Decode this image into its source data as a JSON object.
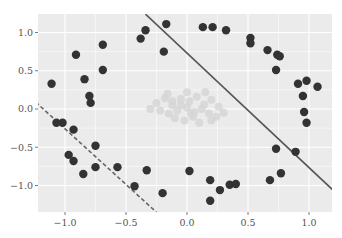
{
  "chart_data": {
    "type": "scatter",
    "title": "",
    "xlabel": "",
    "ylabel": "",
    "xlim": [
      -1.24,
      1.19
    ],
    "ylim": [
      -1.35,
      1.24
    ],
    "grid": true,
    "legend": null,
    "x_ticks": [
      -1.0,
      -0.5,
      0.0,
      0.5,
      1.0
    ],
    "x_tick_labels": [
      "−1.0",
      "−0.5",
      "0.0",
      "0.5",
      "1.0"
    ],
    "y_ticks": [
      1.0,
      0.5,
      0.0,
      -0.5,
      -1.0
    ],
    "y_tick_labels": [
      "1.0",
      "0.5",
      "0.0",
      "−0.5",
      "−1.0"
    ],
    "colors": {
      "background": "#ebebeb",
      "grid": "#ffffff",
      "outer_points": "#333333",
      "inner_points": "#d4d4d4",
      "solid_line": "#555555",
      "dashed_line": "#666666"
    },
    "series": [
      {
        "name": "outer ring",
        "color": "#333333",
        "points": [
          [
            -1.11,
            0.33
          ],
          [
            -0.91,
            0.71
          ],
          [
            -0.84,
            0.39
          ],
          [
            -0.79,
            0.08
          ],
          [
            -0.8,
            0.17
          ],
          [
            -0.69,
            0.84
          ],
          [
            -0.69,
            0.51
          ],
          [
            -0.38,
            0.92
          ],
          [
            -0.34,
            1.03
          ],
          [
            -0.17,
            1.11
          ],
          [
            -0.19,
            0.75
          ],
          [
            0.13,
            1.07
          ],
          [
            0.21,
            1.07
          ],
          [
            0.32,
            1.03
          ],
          [
            0.52,
            0.93
          ],
          [
            0.52,
            0.86
          ],
          [
            0.66,
            0.77
          ],
          [
            0.74,
            0.71
          ],
          [
            0.76,
            0.69
          ],
          [
            0.73,
            0.51
          ],
          [
            0.91,
            0.33
          ],
          [
            0.98,
            0.37
          ],
          [
            1.07,
            0.29
          ],
          [
            0.95,
            0.17
          ],
          [
            0.96,
            -0.04
          ],
          [
            0.98,
            -0.18
          ],
          [
            0.73,
            -0.52
          ],
          [
            0.89,
            -0.56
          ],
          [
            0.77,
            -0.84
          ],
          [
            0.68,
            -0.93
          ],
          [
            0.02,
            -0.81
          ],
          [
            0.19,
            -0.93
          ],
          [
            0.27,
            -1.06
          ],
          [
            0.35,
            -0.99
          ],
          [
            0.4,
            -0.98
          ],
          [
            0.19,
            -1.2
          ],
          [
            -1.07,
            -0.18
          ],
          [
            -1.02,
            -0.18
          ],
          [
            -0.93,
            -0.27
          ],
          [
            -0.97,
            -0.6
          ],
          [
            -0.93,
            -0.68
          ],
          [
            -0.75,
            -0.48
          ],
          [
            -0.75,
            -0.76
          ],
          [
            -0.85,
            -0.85
          ],
          [
            -0.57,
            -0.76
          ],
          [
            -0.33,
            -0.8
          ],
          [
            -0.43,
            -1.01
          ],
          [
            -0.2,
            -1.1
          ]
        ]
      },
      {
        "name": "inner cluster",
        "color": "#d4d4d4",
        "points": [
          [
            -0.25,
            0.08
          ],
          [
            -0.18,
            0.14
          ],
          [
            -0.12,
            0.05
          ],
          [
            -0.05,
            0.13
          ],
          [
            0.02,
            0.1
          ],
          [
            0.08,
            0.16
          ],
          [
            0.14,
            0.06
          ],
          [
            0.2,
            0.12
          ],
          [
            0.26,
            0.03
          ],
          [
            -0.22,
            -0.02
          ],
          [
            -0.15,
            -0.06
          ],
          [
            -0.08,
            -0.02
          ],
          [
            0.0,
            0.02
          ],
          [
            0.06,
            -0.04
          ],
          [
            0.12,
            0.0
          ],
          [
            0.18,
            -0.06
          ],
          [
            0.24,
            -0.1
          ],
          [
            -0.1,
            -0.12
          ],
          [
            -0.02,
            -0.15
          ],
          [
            0.05,
            -0.1
          ],
          [
            0.1,
            -0.18
          ],
          [
            -0.16,
            0.2
          ],
          [
            0.0,
            0.22
          ],
          [
            0.15,
            0.22
          ],
          [
            -0.3,
            0.0
          ],
          [
            0.3,
            -0.05
          ],
          [
            -0.05,
            0.05
          ],
          [
            0.03,
            -0.06
          ],
          [
            0.2,
            -0.15
          ],
          [
            -0.12,
            0.1
          ]
        ]
      }
    ],
    "lines": [
      {
        "name": "solid boundary",
        "style": "solid",
        "color": "#555555",
        "from": [
          -0.34,
          1.24
        ],
        "to": [
          1.19,
          -1.05
        ]
      },
      {
        "name": "dashed boundary",
        "style": "dashed",
        "color": "#666666",
        "from": [
          -1.24,
          0.09
        ],
        "to": [
          -0.25,
          -1.35
        ]
      }
    ]
  }
}
